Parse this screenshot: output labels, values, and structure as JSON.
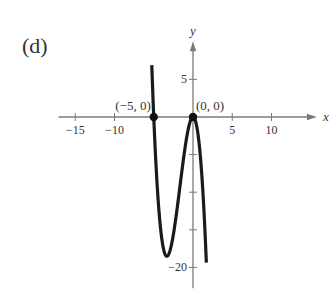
{
  "panel_label": "(d)",
  "chart_data": {
    "type": "line",
    "title": "",
    "function": "f(x) = -x^3 - 5x^2",
    "xlabel": "x",
    "ylabel": "y",
    "xlim": [
      -17,
      14
    ],
    "ylim": [
      -22.5,
      9
    ],
    "x_ticks": [
      -15,
      -10,
      -5,
      5,
      10
    ],
    "x_tick_labels": [
      "-15",
      "-10",
      "",
      "5",
      "10"
    ],
    "y_ticks": [
      5,
      -5,
      -10,
      -15,
      -20
    ],
    "y_tick_labels": [
      "5",
      "",
      "",
      "",
      "-20"
    ],
    "grid": false,
    "series": [
      {
        "name": "f(x)",
        "x_range": [
          -5.25,
          1.7
        ],
        "points": [
          [
            -5.25,
            6.89
          ],
          [
            -5,
            0
          ],
          [
            -4.5,
            -10.13
          ],
          [
            -4,
            -16
          ],
          [
            -3.5,
            -18.38
          ],
          [
            -3.33,
            -18.52
          ],
          [
            -3,
            -18
          ],
          [
            -2.5,
            -15.63
          ],
          [
            -2,
            -12
          ],
          [
            -1.5,
            -7.88
          ],
          [
            -1,
            -4
          ],
          [
            -0.5,
            -1.13
          ],
          [
            0,
            0
          ],
          [
            0.5,
            -1.38
          ],
          [
            1,
            -6
          ],
          [
            1.5,
            -14.63
          ],
          [
            1.7,
            -19.36
          ]
        ]
      }
    ],
    "annotations": [
      {
        "text": "(−5, 0)",
        "x": -5,
        "y": 0
      },
      {
        "text": "(0, 0)",
        "x": 0,
        "y": 0
      }
    ],
    "marked_points": [
      [
        -5,
        0
      ],
      [
        0,
        0
      ]
    ]
  }
}
